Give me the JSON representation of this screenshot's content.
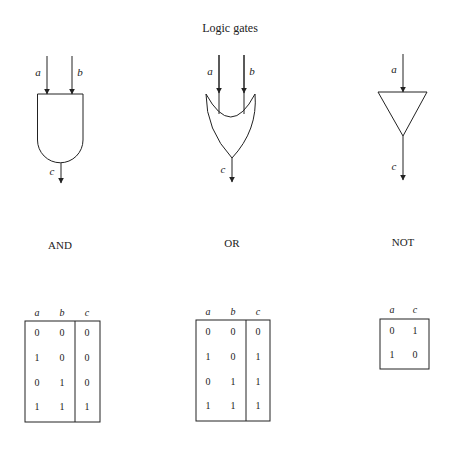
{
  "title": "Logic gates",
  "gates": [
    {
      "name": "AND",
      "inputs": [
        "a",
        "b"
      ],
      "output": "c",
      "label": "AND",
      "truth_table": {
        "headers": [
          "a",
          "b",
          "c"
        ],
        "rows": [
          [
            "0",
            "0",
            "0"
          ],
          [
            "1",
            "0",
            "0"
          ],
          [
            "0",
            "1",
            "0"
          ],
          [
            "1",
            "1",
            "1"
          ]
        ]
      }
    },
    {
      "name": "OR",
      "inputs": [
        "a",
        "b"
      ],
      "output": "c",
      "label": "OR",
      "truth_table": {
        "headers": [
          "a",
          "b",
          "c"
        ],
        "rows": [
          [
            "0",
            "0",
            "0"
          ],
          [
            "1",
            "0",
            "1"
          ],
          [
            "0",
            "1",
            "1"
          ],
          [
            "1",
            "1",
            "1"
          ]
        ]
      }
    },
    {
      "name": "NOT",
      "inputs": [
        "a"
      ],
      "output": "c",
      "label": "NOT",
      "truth_table": {
        "headers": [
          "a",
          "c"
        ],
        "rows": [
          [
            "0",
            "1"
          ],
          [
            "1",
            "0"
          ]
        ]
      }
    }
  ]
}
